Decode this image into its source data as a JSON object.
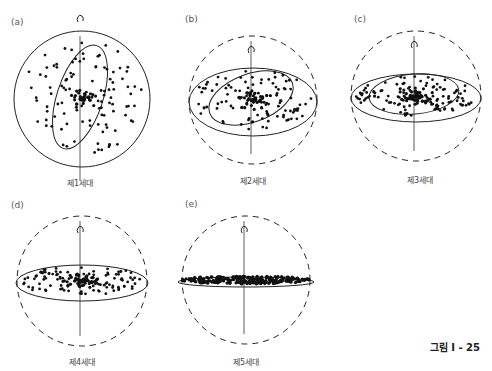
{
  "figure_label": "그림 I - 25",
  "panels": [
    {
      "id": "a",
      "label": "(a)",
      "caption": "제1세대",
      "cx": 82,
      "cy": 99,
      "r": 68,
      "outer": "solid",
      "inner_ellipse": {
        "rx": 23,
        "ry": 54,
        "rot": 18
      },
      "disk": null,
      "dots": 110,
      "core": 45,
      "spread": [
        60,
        60
      ]
    },
    {
      "id": "b",
      "label": "(b)",
      "caption": "제2세대",
      "cx": 253,
      "cy": 100,
      "r": 64,
      "outer": "dashed",
      "inner_ellipse": {
        "rx": 44,
        "ry": 24,
        "rot": -20
      },
      "disk": {
        "rx": 64,
        "ry": 34
      },
      "dots": 110,
      "core": 45,
      "spread": [
        60,
        30
      ]
    },
    {
      "id": "c",
      "label": "(c)",
      "caption": "제3세대",
      "cx": 416,
      "cy": 96,
      "r": 65,
      "outer": "dashed",
      "inner_ellipse": {
        "rx": 45,
        "ry": 20,
        "rot": -5
      },
      "disk": {
        "rx": 65,
        "ry": 24
      },
      "dots": 120,
      "core": 60,
      "spread": [
        60,
        20
      ]
    },
    {
      "id": "d",
      "label": "(d)",
      "caption": "제4세대",
      "cx": 82,
      "cy": 281,
      "r": 65,
      "outer": "dashed",
      "inner_ellipse": null,
      "disk": {
        "rx": 66,
        "ry": 18
      },
      "dots": 110,
      "core": 55,
      "spread": [
        62,
        15
      ]
    },
    {
      "id": "e",
      "label": "(e)",
      "caption": "제5세대",
      "cx": 246,
      "cy": 280,
      "r": 64,
      "outer": "dashed",
      "inner_ellipse": null,
      "disk": {
        "rx": 68,
        "ry": 5
      },
      "dots": 260,
      "core": 0,
      "spread": [
        66,
        4
      ]
    }
  ]
}
